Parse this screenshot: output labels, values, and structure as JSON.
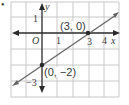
{
  "figure": {
    "bullet": "•",
    "axes": {
      "x_label": "x",
      "y_label": "y",
      "origin_label": "O",
      "x_ticks": [
        {
          "value": 1,
          "label": "1"
        },
        {
          "value": 3,
          "label": "3"
        },
        {
          "value": 4,
          "label": "4"
        }
      ],
      "y_ticks": [
        {
          "value": 1,
          "label": "1"
        },
        {
          "value": -3,
          "label": "−3"
        }
      ]
    },
    "points": [
      {
        "label": "(3, 0)",
        "x": 3,
        "y": 0
      },
      {
        "label": "(0, −2)",
        "x": 0,
        "y": -2
      }
    ],
    "line": {
      "description": "line through (0, -2) and (3, 0)",
      "slope": "2/3",
      "y_intercept": -2,
      "x_intercept": 3
    },
    "colors": {
      "grid": "#c8c8c8",
      "axis": "#2a2a2a",
      "line": "#666666",
      "text": "#3a3a3a"
    }
  }
}
